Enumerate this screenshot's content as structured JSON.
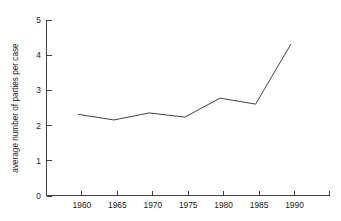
{
  "chart_data": {
    "type": "line",
    "title": "",
    "subtitle": "",
    "xlabel": "",
    "ylabel": "average number of parties per case",
    "x": [
      1960,
      1965,
      1970,
      1975,
      1980,
      1985,
      1990
    ],
    "values": [
      2.32,
      2.16,
      2.36,
      2.24,
      2.78,
      2.61,
      4.32
    ],
    "series": [
      {
        "name": "average number of parties per case",
        "values": [
          2.32,
          2.16,
          2.36,
          2.24,
          2.78,
          2.61,
          4.32
        ]
      }
    ],
    "xlim": [
      1955.5,
      1995.5
    ],
    "ylim": [
      0,
      5
    ],
    "xticks": [
      1960,
      1965,
      1970,
      1975,
      1980,
      1985,
      1990
    ],
    "xticklabels": [
      "1960",
      "1965",
      "1970",
      "1975",
      "1980",
      "1985",
      "1990"
    ],
    "yticks": [
      0,
      1,
      2,
      3,
      4,
      5
    ],
    "yticklabels": [
      "0",
      "1",
      "2",
      "3",
      "4",
      "5"
    ],
    "grid": false,
    "legend": false,
    "legend_position": "none",
    "markers": false,
    "line_color": "#2b2b2b",
    "background_color": "#ffffff",
    "axis_color": "#2b2b2b"
  },
  "axes": {
    "y_title": "average number of parties per case",
    "y_tick_labels": [
      "0",
      "1",
      "2",
      "3",
      "4",
      "5"
    ],
    "x_tick_labels": [
      "1960",
      "1965",
      "1970",
      "1975",
      "1980",
      "1985",
      "1990"
    ]
  }
}
